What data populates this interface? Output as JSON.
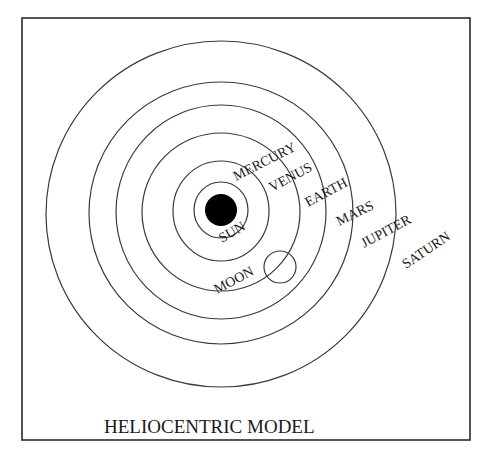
{
  "diagram": {
    "title": "HELIOCENTRIC MODEL",
    "colors": {
      "ink": "#1a1a1a",
      "orbit": "#3a3a3a",
      "sun": "#000000",
      "background": "#ffffff"
    },
    "bodies": {
      "sun": "SUN",
      "moon": "MOON"
    },
    "planets": [
      {
        "name": "MERCURY"
      },
      {
        "name": "VENUS"
      },
      {
        "name": "EARTH"
      },
      {
        "name": "MARS"
      },
      {
        "name": "JUPITER"
      },
      {
        "name": "SATURN"
      }
    ]
  }
}
